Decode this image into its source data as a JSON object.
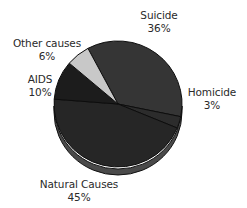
{
  "chart_data": {
    "type": "pie",
    "title": "",
    "style": "3d-tilted",
    "categories": [
      "Suicide",
      "Homicide",
      "Natural Causes",
      "AIDS",
      "Other causes"
    ],
    "values": [
      36,
      3,
      45,
      10,
      6
    ],
    "unit": "%",
    "colors": [
      "#353535",
      "#2c2c2c",
      "#262626",
      "#1c1c1c",
      "#c8c8c8"
    ],
    "legend": "none",
    "labels_outside": true
  },
  "labels": {
    "suicide": {
      "name": "Suicide",
      "pct": "36%"
    },
    "homicide": {
      "name": "Homicide",
      "pct": "3%"
    },
    "natural": {
      "name": "Natural Causes",
      "pct": "45%"
    },
    "aids": {
      "name": "AIDS",
      "pct": "10%"
    },
    "other": {
      "name": "Other causes",
      "pct": "6%"
    }
  }
}
